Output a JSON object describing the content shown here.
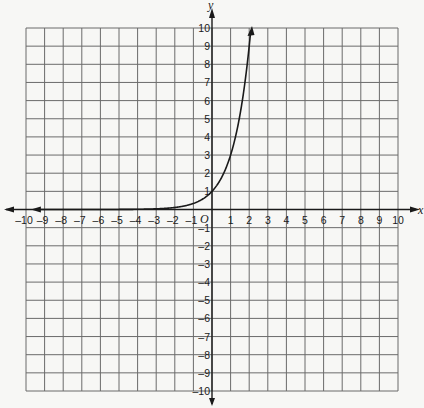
{
  "chart_data": {
    "type": "line",
    "title": "",
    "xlabel": "x",
    "ylabel": "y",
    "origin_label": "O",
    "xlim": [
      -10,
      10
    ],
    "ylim": [
      -10,
      10
    ],
    "grid": true,
    "x_ticks": [
      -10,
      -9,
      -8,
      -7,
      -6,
      -5,
      -4,
      -3,
      -2,
      -1,
      1,
      2,
      3,
      4,
      5,
      6,
      7,
      8,
      9,
      10
    ],
    "y_ticks": [
      10,
      9,
      8,
      7,
      6,
      5,
      4,
      3,
      2,
      1,
      -1,
      -2,
      -3,
      -4,
      -5,
      -6,
      -7,
      -8,
      -9,
      -10
    ],
    "series": [
      {
        "name": "exponential curve",
        "function": "y = 3^x",
        "x": [
          -10,
          -5,
          -3,
          -2,
          -1,
          0,
          0.5,
          1,
          1.5,
          2,
          2.096
        ],
        "y": [
          2e-05,
          0.004,
          0.037,
          0.111,
          0.333,
          1,
          1.732,
          3,
          5.196,
          9,
          10
        ],
        "left_arrow": true,
        "right_arrow": true
      }
    ],
    "legend": null
  },
  "colors": {
    "background": "#f7f7f5",
    "grid": "#6b6b6b",
    "ink": "#1a1a1a"
  }
}
